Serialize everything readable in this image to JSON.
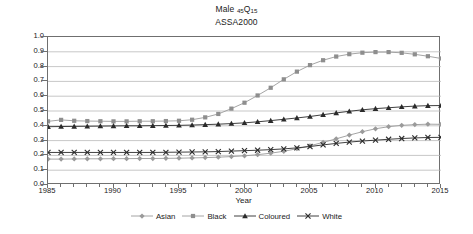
{
  "chart_data": {
    "type": "line",
    "title": "Male 45Q15",
    "title_main": "Male",
    "title_sub1": "45",
    "title_sub_q": "Q",
    "title_sub2": "15",
    "subtitle": "ASSA2000",
    "xlabel": "Year",
    "ylabel": "",
    "xlim": [
      1985,
      2015
    ],
    "ylim": [
      0.0,
      1.0
    ],
    "grid": "horizontal",
    "legend_position": "bottom",
    "xticks": [
      1985,
      1990,
      1995,
      2000,
      2005,
      2010,
      2015
    ],
    "xtick_labels": [
      "1985",
      "1990",
      "1995",
      "2000",
      "2005",
      "2010",
      "2015"
    ],
    "yticks": [
      0.0,
      0.1,
      0.2,
      0.3,
      0.4,
      0.5,
      0.6,
      0.7,
      0.8,
      0.9,
      1.0
    ],
    "ytick_labels": [
      "0.0",
      "0.1",
      "0.2",
      "0.3",
      "0.4",
      "0.5",
      "0.6",
      "0.7",
      "0.8",
      "0.9",
      "1.0"
    ],
    "x": [
      1985,
      1986,
      1987,
      1988,
      1989,
      1990,
      1991,
      1992,
      1993,
      1994,
      1995,
      1996,
      1997,
      1998,
      1999,
      2000,
      2001,
      2002,
      2003,
      2004,
      2005,
      2006,
      2007,
      2008,
      2009,
      2010,
      2011,
      2012,
      2013,
      2014,
      2015
    ],
    "series": [
      {
        "name": "Asian",
        "marker": "diamond",
        "color": "#9a9a9a",
        "line_color": "#9a9a9a",
        "values": [
          0.175,
          0.175,
          0.176,
          0.177,
          0.177,
          0.178,
          0.178,
          0.179,
          0.179,
          0.18,
          0.181,
          0.183,
          0.185,
          0.188,
          0.192,
          0.197,
          0.205,
          0.215,
          0.228,
          0.245,
          0.265,
          0.288,
          0.312,
          0.337,
          0.36,
          0.38,
          0.394,
          0.403,
          0.408,
          0.411,
          0.41
        ]
      },
      {
        "name": "Black",
        "marker": "square",
        "color": "#8e8e8e",
        "line_color": "#9a9a9a",
        "values": [
          0.43,
          0.44,
          0.434,
          0.432,
          0.431,
          0.43,
          0.43,
          0.431,
          0.431,
          0.432,
          0.434,
          0.441,
          0.457,
          0.48,
          0.516,
          0.556,
          0.605,
          0.657,
          0.714,
          0.766,
          0.81,
          0.843,
          0.868,
          0.884,
          0.894,
          0.898,
          0.898,
          0.893,
          0.883,
          0.87,
          0.855
        ]
      },
      {
        "name": "Coloured",
        "marker": "triangle",
        "color": "#2a2a2a",
        "line_color": "#2a2a2a",
        "values": [
          0.394,
          0.395,
          0.396,
          0.397,
          0.398,
          0.399,
          0.4,
          0.4,
          0.401,
          0.402,
          0.403,
          0.405,
          0.408,
          0.411,
          0.415,
          0.42,
          0.427,
          0.435,
          0.444,
          0.453,
          0.463,
          0.475,
          0.487,
          0.498,
          0.508,
          0.516,
          0.522,
          0.528,
          0.533,
          0.536,
          0.537
        ]
      },
      {
        "name": "White",
        "marker": "cross",
        "color": "#2a2a2a",
        "line_color": "#2a2a2a",
        "values": [
          0.22,
          0.22,
          0.22,
          0.22,
          0.22,
          0.22,
          0.22,
          0.22,
          0.22,
          0.221,
          0.222,
          0.223,
          0.224,
          0.226,
          0.229,
          0.232,
          0.235,
          0.239,
          0.244,
          0.251,
          0.26,
          0.271,
          0.281,
          0.29,
          0.297,
          0.303,
          0.309,
          0.314,
          0.318,
          0.321,
          0.322
        ]
      }
    ]
  },
  "legend": {
    "items": [
      {
        "label": "Asian"
      },
      {
        "label": "Black"
      },
      {
        "label": "Coloured"
      },
      {
        "label": "White"
      }
    ]
  }
}
